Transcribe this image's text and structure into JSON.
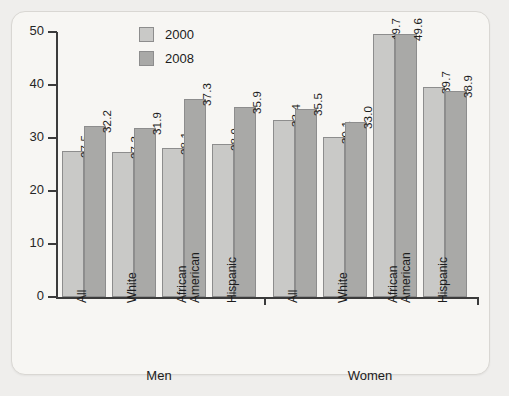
{
  "chart_data": {
    "type": "bar",
    "title": "",
    "xlabel": "",
    "ylabel": "",
    "ylim": [
      0,
      50
    ],
    "yticks": [
      0,
      10,
      20,
      30,
      40,
      50
    ],
    "grid": false,
    "legend_position": "top-left-inside",
    "categories": [
      "All",
      "White",
      "African American",
      "Hispanic",
      "All",
      "White",
      "African American",
      "Hispanic"
    ],
    "groups": [
      {
        "name": "Men",
        "categories": [
          {
            "label_lines": [
              "All"
            ],
            "values": {
              "2000": 27.5,
              "2008": 32.2
            }
          },
          {
            "label_lines": [
              "White"
            ],
            "values": {
              "2000": 27.3,
              "2008": 31.9
            }
          },
          {
            "label_lines": [
              "African",
              "American"
            ],
            "values": {
              "2000": 28.1,
              "2008": 37.3
            }
          },
          {
            "label_lines": [
              "Hispanic"
            ],
            "values": {
              "2000": 28.9,
              "2008": 35.9
            }
          }
        ]
      },
      {
        "name": "Women",
        "categories": [
          {
            "label_lines": [
              "All"
            ],
            "values": {
              "2000": 33.4,
              "2008": 35.5
            }
          },
          {
            "label_lines": [
              "White"
            ],
            "values": {
              "2000": 30.1,
              "2008": 33.0
            }
          },
          {
            "label_lines": [
              "African",
              "American"
            ],
            "values": {
              "2000": 49.7,
              "2008": 49.6
            }
          },
          {
            "label_lines": [
              "Hispanic"
            ],
            "values": {
              "2000": 39.7,
              "2008": 38.9
            }
          }
        ]
      }
    ],
    "series": [
      {
        "name": "2000",
        "color": "#c9c9c7",
        "values": [
          27.5,
          27.3,
          28.1,
          28.9,
          33.4,
          30.1,
          49.7,
          39.7
        ]
      },
      {
        "name": "2008",
        "color": "#a9a9a7",
        "values": [
          32.2,
          31.9,
          37.3,
          35.9,
          35.5,
          33.0,
          49.6,
          38.9
        ]
      }
    ]
  },
  "legend": {
    "items": [
      {
        "label": "2000",
        "series_key": "s2000"
      },
      {
        "label": "2008",
        "series_key": "s2008"
      }
    ]
  },
  "axis": {
    "y_tick_labels": [
      "0",
      "10",
      "20",
      "30",
      "40",
      "50"
    ]
  },
  "colors": {
    "series_2000": "#c9c9c7",
    "series_2008": "#a9a9a7",
    "axis": "#3b3b3b",
    "bar_border": "#8d8d8d",
    "card_background": "#f7f6f3",
    "page_background": "#efeeec",
    "text": "#1c1c1c"
  }
}
